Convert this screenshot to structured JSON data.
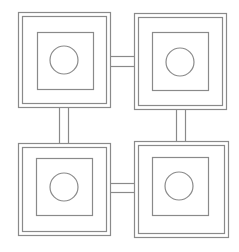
{
  "diagram": {
    "stroke_color": "#8a8a8a",
    "background": "#ffffff",
    "modules": [
      {
        "id": "top-left",
        "outer": [
          18,
          12,
          92,
          95
        ],
        "inner_gap": 4,
        "core": [
          37,
          32,
          56,
          57
        ],
        "circle": [
          64,
          60,
          14
        ]
      },
      {
        "id": "top-right",
        "outer": [
          134,
          13,
          92,
          96
        ],
        "inner_gap": 4,
        "core": [
          152,
          32,
          56,
          58
        ],
        "circle": [
          180,
          62,
          14
        ]
      },
      {
        "id": "bottom-left",
        "outer": [
          18,
          143,
          92,
          92
        ],
        "inner_gap": 4,
        "core": [
          36,
          158,
          56,
          57
        ],
        "circle": [
          64,
          187,
          14
        ]
      },
      {
        "id": "bottom-right",
        "outer": [
          134,
          141,
          94,
          96
        ],
        "inner_gap": 4,
        "core": [
          152,
          157,
          56,
          58
        ],
        "circle": [
          179,
          186,
          14
        ]
      }
    ],
    "connectors": [
      {
        "id": "top-horizontal",
        "orientation": "h",
        "x1": 110,
        "x2": 134,
        "a": 56,
        "b": 66
      },
      {
        "id": "bottom-horizontal",
        "orientation": "h",
        "x1": 110,
        "x2": 134,
        "a": 183,
        "b": 192
      },
      {
        "id": "left-vertical",
        "orientation": "v",
        "y1": 107,
        "y2": 143,
        "a": 59,
        "b": 68
      },
      {
        "id": "right-vertical",
        "orientation": "v",
        "y1": 109,
        "y2": 141,
        "a": 176,
        "b": 185
      }
    ]
  }
}
